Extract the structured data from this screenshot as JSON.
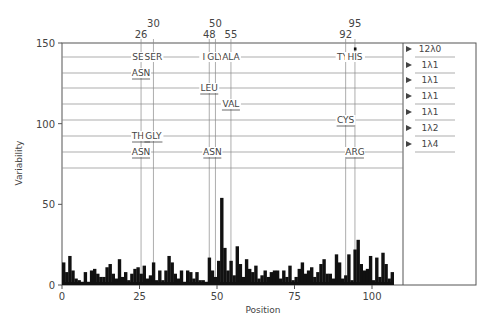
{
  "chart_data": {
    "type": "bar",
    "title": "",
    "xlabel": "Position",
    "ylabel": "Variability",
    "xlim": [
      0,
      110
    ],
    "ylim": [
      0,
      150
    ],
    "xticks": [
      0,
      25,
      50,
      75,
      100
    ],
    "yticks": [
      0,
      50,
      100,
      150
    ],
    "grid": false,
    "positions_start": 1,
    "values": [
      14,
      8,
      18,
      9,
      4,
      3,
      2,
      8,
      2,
      9,
      10,
      7,
      5,
      5,
      11,
      13,
      7,
      4,
      16,
      5,
      8,
      3,
      7,
      10,
      11,
      7,
      12,
      4,
      6,
      14,
      3,
      9,
      3,
      9,
      18,
      14,
      7,
      4,
      9,
      2,
      9,
      8,
      4,
      8,
      3,
      3,
      2,
      17,
      9,
      5,
      15,
      54,
      23,
      9,
      15,
      6,
      24,
      13,
      5,
      16,
      10,
      8,
      12,
      4,
      6,
      9,
      5,
      8,
      9,
      9,
      4,
      9,
      5,
      12,
      3,
      5,
      10,
      14,
      7,
      9,
      11,
      5,
      8,
      13,
      16,
      7,
      7,
      4,
      19,
      14,
      4,
      6,
      19,
      3,
      22,
      28,
      13,
      9,
      10,
      18,
      3,
      17,
      5,
      20,
      13,
      4,
      8
    ],
    "peaks": [
      {
        "position": 28,
        "value": 54
      },
      {
        "position": 49,
        "value": 47
      },
      {
        "position": 95,
        "value": 138
      },
      {
        "position": 95,
        "marker_value": 146
      }
    ],
    "top_markers": [
      {
        "position": 26,
        "label": "26"
      },
      {
        "position": 30,
        "label": "30"
      },
      {
        "position": 48,
        "label": "48"
      },
      {
        "position": 50,
        "label": "50"
      },
      {
        "position": 55,
        "label": "55"
      },
      {
        "position": 92,
        "label": "92"
      },
      {
        "position": 95,
        "label": "95"
      }
    ],
    "rows": [
      {
        "lambda": "12λ0",
        "residues": [
          {
            "text": "SER",
            "position": 26,
            "underline": false
          },
          {
            "text": "SER",
            "position": 30,
            "underline": false
          },
          {
            "text": "ILE",
            "position": 48,
            "underline": false
          },
          {
            "text": "GLY",
            "position": 50,
            "underline": false
          },
          {
            "text": "ALA",
            "position": 55,
            "underline": false
          },
          {
            "text": "TYR",
            "position": 92,
            "underline": false
          },
          {
            "text": "HIS",
            "position": 95,
            "underline": false
          }
        ]
      },
      {
        "lambda": "1λ1",
        "residues": [
          {
            "text": "ASN",
            "position": 26,
            "underline": true
          }
        ]
      },
      {
        "lambda": "1λ1",
        "residues": [
          {
            "text": "LEU",
            "position": 48,
            "underline": true
          }
        ]
      },
      {
        "lambda": "1λ1",
        "residues": [
          {
            "text": "VAL",
            "position": 55,
            "underline": true
          }
        ]
      },
      {
        "lambda": "1λ1",
        "residues": [
          {
            "text": "CYS",
            "position": 92,
            "underline": true
          }
        ]
      },
      {
        "lambda": "1λ2",
        "residues": [
          {
            "text": "THR",
            "position": 26,
            "underline": true
          },
          {
            "text": "GLY",
            "position": 30,
            "underline": true
          }
        ]
      },
      {
        "lambda": "1λ4",
        "residues": [
          {
            "text": "ASN",
            "position": 26,
            "underline": true
          },
          {
            "text": "ASN",
            "position": 49,
            "underline": true
          },
          {
            "text": "ARG",
            "position": 95,
            "underline": true
          }
        ]
      }
    ],
    "colors": {
      "bars": "#111111",
      "axis": "#555555",
      "grid": "#8a8a8a",
      "text": "#444444"
    }
  }
}
